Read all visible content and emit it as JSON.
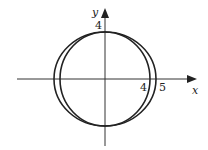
{
  "diagram": {
    "type": "graph-of-conics",
    "colors": {
      "stroke": "#222222",
      "axis": "#333333",
      "background": "#ffffff"
    },
    "axes": {
      "x_label": "x",
      "y_label": "y"
    },
    "tick_labels": {
      "y_top": "4",
      "x_circle": "4",
      "x_ellipse": "5"
    },
    "curves": [
      {
        "name": "circle",
        "description": "circle of radius 4 centered at origin",
        "rx": 4,
        "ry": 4
      },
      {
        "name": "ellipse",
        "description": "ellipse with semi-axes 5 (x) and 4 (y) centered at origin",
        "rx": 5,
        "ry": 4
      }
    ]
  }
}
